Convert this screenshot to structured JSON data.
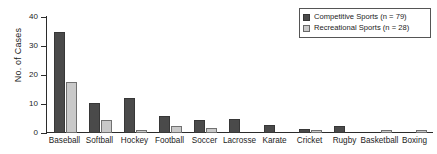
{
  "chart_data": {
    "type": "bar",
    "title": "",
    "xlabel": "",
    "ylabel": "No. of Cases",
    "ylim": [
      0,
      40
    ],
    "yticks": [
      0,
      10,
      20,
      30,
      40
    ],
    "ytick_labels": [
      "0",
      "10",
      "20",
      "30",
      "40"
    ],
    "grid": false,
    "legend_position": "top-right",
    "categories": [
      "Baseball",
      "Softball",
      "Hockey",
      "Football",
      "Soccer",
      "Lacrosse",
      "Karate",
      "Cricket",
      "Rugby",
      "Basketball",
      "Boxing"
    ],
    "series": [
      {
        "name": "Competitive Sports (n = 79)",
        "color": "#4a4a4a",
        "values": [
          35,
          10.5,
          12,
          6,
          4.5,
          5,
          2.6,
          1.5,
          2.4,
          0,
          0
        ]
      },
      {
        "name": "Recreational Sports (n = 28)",
        "color": "#c9c9c9",
        "values": [
          17.5,
          4.6,
          1.2,
          2.3,
          1.7,
          0,
          0,
          1.1,
          0,
          1.1,
          1.1
        ]
      }
    ]
  },
  "legend": {
    "entries": [
      {
        "label": "Competitive Sports (n = 79)",
        "swatch": "competitive"
      },
      {
        "label": "Recreational Sports (n = 28)",
        "swatch": "recreational"
      }
    ]
  },
  "axes": {
    "y_title": "No. of Cases"
  }
}
